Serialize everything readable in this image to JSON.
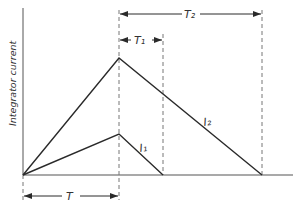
{
  "diagram": {
    "y_axis_label": "Integrator current",
    "labels": {
      "T": "T",
      "T1": "T₁",
      "T2": "T₂",
      "I1": "I₁",
      "I2": "I₂"
    },
    "colors": {
      "line": "#2a2a2a",
      "dashed": "#777777",
      "text": "#333333"
    },
    "points": {
      "origin": [
        23,
        175
      ],
      "peak_I2": [
        119,
        58
      ],
      "peak_I1": [
        119,
        134
      ],
      "end_I1": [
        163,
        175
      ],
      "end_I2": [
        262,
        175
      ],
      "x_axis_end": [
        293,
        175
      ],
      "y_axis_top": [
        23,
        8
      ]
    }
  }
}
